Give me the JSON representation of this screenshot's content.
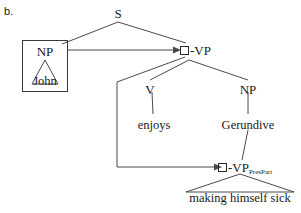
{
  "figure": {
    "item_label": "b.",
    "background_color": "#ffffff",
    "line_color": "#4a4a4a"
  },
  "tree": {
    "root": {
      "label": "S",
      "x": 118,
      "y": 14
    },
    "subject": {
      "box_label": "NP",
      "terminal": "John",
      "triangle": true
    },
    "vp_upper": {
      "square": "empty-box",
      "label": "-VP"
    },
    "verb": {
      "label": "V",
      "terminal": "enjoys"
    },
    "object": {
      "label": "NP",
      "terminal": "Gerundive"
    },
    "vp_lower": {
      "square": "empty-box",
      "label": "-VP",
      "subscript": "PresPart",
      "terminal": "making himself sick",
      "triangle": true
    }
  },
  "arrows": {
    "subject_control": {
      "from": "NP-John box",
      "to": "upper -VP node",
      "style": "horizontal-arrow"
    },
    "vp_control": {
      "from": "upper -VP node",
      "to": "lower -VP PresPart node",
      "style": "elbow-arrow"
    }
  },
  "icons": {
    "arrowhead": "arrowhead-icon",
    "empty_square": "empty-square-icon",
    "triangle": "triangle-icon"
  }
}
